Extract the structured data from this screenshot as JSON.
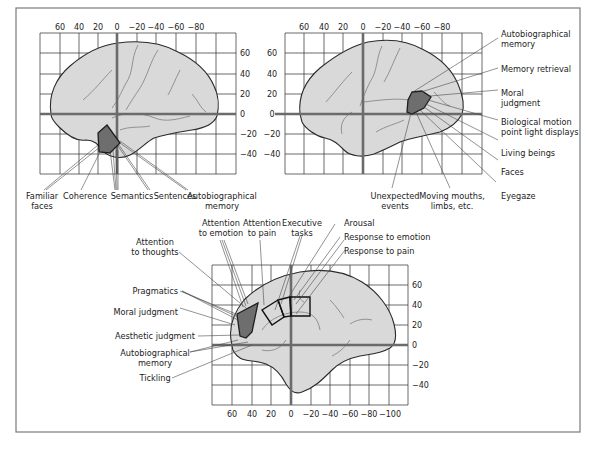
{
  "figure": {
    "colors": {
      "brain_fill": "#d9d9d9",
      "region_fill": "#6e6e6e",
      "axis_zero_line": "#6b6b6b",
      "frame": "#7a7a7a"
    },
    "panels": [
      {
        "id": "top-left",
        "view": "lateral left hemisphere",
        "x_ticks": [
          "60",
          "40",
          "20",
          "0",
          "−20",
          "−40",
          "−60",
          "−80"
        ],
        "y_ticks": [
          "60",
          "40",
          "20",
          "0",
          "−20",
          "−40"
        ],
        "labels": [
          {
            "line1": "Familiar",
            "line2": "faces"
          },
          {
            "line1": "Coherence",
            "line2": ""
          },
          {
            "line1": "Semantics",
            "line2": ""
          },
          {
            "line1": "Sentences",
            "line2": ""
          },
          {
            "line1": "Autobiographical",
            "line2": "memory"
          }
        ]
      },
      {
        "id": "top-right",
        "view": "lateral right hemisphere",
        "x_ticks": [
          "60",
          "40",
          "20",
          "0",
          "−20",
          "−40",
          "−60",
          "−80"
        ],
        "y_ticks": [
          "60",
          "40",
          "20",
          "0",
          "−20",
          "−40"
        ],
        "labels": [
          {
            "line1": "Autobiographical",
            "line2": "memory"
          },
          {
            "line1": "Memory retrieval",
            "line2": ""
          },
          {
            "line1": "Moral",
            "line2": "judgment"
          },
          {
            "line1": "Biological motion",
            "line2": "point light displays"
          },
          {
            "line1": "Living beings",
            "line2": ""
          },
          {
            "line1": "Faces",
            "line2": ""
          },
          {
            "line1": "Eyegaze",
            "line2": ""
          },
          {
            "line1": "Unexpected",
            "line2": "events"
          },
          {
            "line1": "Moving mouths,",
            "line2": "limbs, etc."
          }
        ]
      },
      {
        "id": "bottom",
        "view": "medial hemisphere",
        "x_ticks": [
          "60",
          "40",
          "20",
          "0",
          "−20",
          "−40",
          "−60",
          "−80",
          "−100"
        ],
        "y_ticks": [
          "60",
          "40",
          "20",
          "0",
          "−20",
          "−40"
        ],
        "labels": [
          {
            "line1": "Attention",
            "line2": "to thoughts"
          },
          {
            "line1": "Attention",
            "line2": "to emotion"
          },
          {
            "line1": "Attention",
            "line2": "to pain"
          },
          {
            "line1": "Executive",
            "line2": "tasks"
          },
          {
            "line1": "Arousal",
            "line2": ""
          },
          {
            "line1": "Response to emotion",
            "line2": ""
          },
          {
            "line1": "Response to pain",
            "line2": ""
          },
          {
            "line1": "Pragmatics",
            "line2": ""
          },
          {
            "line1": "Moral judgment",
            "line2": ""
          },
          {
            "line1": "Aesthetic judgment",
            "line2": ""
          },
          {
            "line1": "Autobiographical",
            "line2": "memory"
          },
          {
            "line1": "Tickling",
            "line2": ""
          }
        ]
      }
    ]
  }
}
